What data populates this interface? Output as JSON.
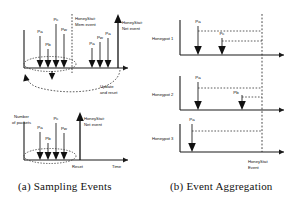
{
  "figure": {
    "caption_a": "(a) Sampling Events",
    "caption_b": "(b) Event Aggregation"
  },
  "panel_a": {
    "chart_top": {
      "axis_label_time": "",
      "annotations": {
        "mem_event": "HoneyStat:\nMem event",
        "mem_event_line1": "HoneyStat:",
        "mem_event_line2": "Mem event",
        "net_event_line1": "HoneyStat:",
        "net_event_line2": "Net event",
        "update_line1": "Update",
        "update_line2": "and reset"
      },
      "events_before": [
        {
          "label": "Pa",
          "x": 40,
          "height": 26
        },
        {
          "label": "Pb",
          "x": 48,
          "height": 13
        },
        {
          "label": "Pc",
          "x": 56,
          "height": 34
        },
        {
          "label": "Pw",
          "x": 64,
          "height": 24
        }
      ],
      "events_after": [
        {
          "label": "Pa",
          "x": 92,
          "height": 14
        },
        {
          "label": "Pw",
          "x": 100,
          "height": 20
        },
        {
          "label": "Pa",
          "x": 108,
          "height": 24
        }
      ]
    },
    "chart_bottom": {
      "y_axis_label_line1": "Number",
      "y_axis_label_line2": "of packets",
      "x_axis_label": "Time",
      "reset_label": "Reset",
      "net_event_line1": "HoneyStat:",
      "net_event_line2": "Net event",
      "events": [
        {
          "label": "Pa",
          "x": 40,
          "height": 22
        },
        {
          "label": "Pb",
          "x": 48,
          "height": 11
        },
        {
          "label": "Pc",
          "x": 56,
          "height": 31
        },
        {
          "label": "Pw",
          "x": 64,
          "height": 21
        }
      ]
    }
  },
  "panel_b": {
    "rows": [
      {
        "name": "Honeypot 1",
        "events": [
          {
            "label": "Pa",
            "x": 38
          },
          {
            "label": "Pc",
            "x": 62
          }
        ]
      },
      {
        "name": "Honeypot 2",
        "events": [
          {
            "label": "Pa",
            "x": 38
          },
          {
            "label": "Pb",
            "x": 78
          }
        ]
      },
      {
        "name": "Honeypot 3",
        "events": [
          {
            "label": "Pa",
            "x": 30
          }
        ]
      }
    ],
    "honeystat_event_line1": "HoneyStat",
    "honeystat_event_line2": "Event"
  },
  "colors": {
    "ink": "#111111",
    "axis": "#1a1a1a",
    "dashed": "#333333",
    "background": "#ffffff"
  }
}
